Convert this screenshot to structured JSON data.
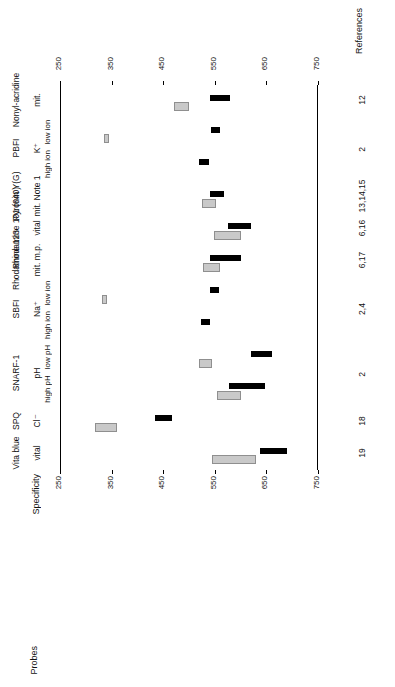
{
  "headers": {
    "probes": "Probes",
    "specificity": "Specificity",
    "references": "References"
  },
  "axis": {
    "ticks": [
      250,
      350,
      450,
      550,
      650,
      750
    ],
    "min": 250,
    "max": 750,
    "label": ""
  },
  "chart_data": {
    "type": "bar",
    "title": "",
    "xlabel": "Probes",
    "ylabel": "Wavelength (nm)",
    "ylim": [
      250,
      750
    ],
    "grid": false,
    "legend": [
      "excitation (black)",
      "emission (gray)"
    ],
    "categories": [
      "Nonyl-acridine",
      "PBFI",
      "Pyronin Y(G)",
      "Rhodamine 101 (640)",
      "Rhodamine 123",
      "SBFI",
      "SNARF-1",
      "SPQ",
      "Vita blue"
    ],
    "rows": [
      {
        "probe": "Nonyl-acridine",
        "sub": "",
        "specificity": "mit.",
        "references": "12",
        "bars": [
          {
            "series": "black",
            "start": 540,
            "end": 580,
            "lane": 0
          },
          {
            "series": "gray",
            "start": 470,
            "end": 500,
            "lane": 1
          }
        ]
      },
      {
        "probe": "PBFI",
        "sub": "low ion",
        "specificity": "K⁺",
        "references": "2",
        "bars": [
          {
            "series": "black",
            "start": 543,
            "end": 560,
            "lane": 0
          },
          {
            "series": "gray",
            "start": 335,
            "end": 345,
            "lane": 1
          }
        ]
      },
      {
        "probe": "PBFI",
        "sub": "high ion",
        "specificity": "",
        "references": "",
        "bars": [
          {
            "series": "black",
            "start": 520,
            "end": 538,
            "lane": 0
          }
        ]
      },
      {
        "probe": "Pyronin Y(G)",
        "sub": "",
        "specificity": "mit. Note 1",
        "references": "13,14,15",
        "bars": [
          {
            "series": "black",
            "start": 540,
            "end": 568,
            "lane": 0
          },
          {
            "series": "gray",
            "start": 525,
            "end": 552,
            "lane": 1
          }
        ]
      },
      {
        "probe": "Rhodamine 101 (640)",
        "sub": "",
        "specificity": "vital",
        "references": "6,16",
        "bars": [
          {
            "series": "black",
            "start": 575,
            "end": 620,
            "lane": 0
          },
          {
            "series": "gray",
            "start": 548,
            "end": 600,
            "lane": 1
          }
        ]
      },
      {
        "probe": "Rhodamine 123",
        "sub": "",
        "specificity": "mit. m.p.",
        "references": "6,17",
        "bars": [
          {
            "series": "black",
            "start": 540,
            "end": 600,
            "lane": 0
          },
          {
            "series": "gray",
            "start": 528,
            "end": 560,
            "lane": 1
          }
        ]
      },
      {
        "probe": "SBFI",
        "sub": "low ion",
        "specificity": "Na⁺",
        "references": "2,4",
        "bars": [
          {
            "series": "black",
            "start": 540,
            "end": 558,
            "lane": 0
          },
          {
            "series": "gray",
            "start": 332,
            "end": 342,
            "lane": 1
          }
        ]
      },
      {
        "probe": "SBFI",
        "sub": "high ion",
        "specificity": "",
        "references": "",
        "bars": [
          {
            "series": "black",
            "start": 523,
            "end": 540,
            "lane": 0
          }
        ]
      },
      {
        "probe": "SNARF-1",
        "sub": "low pH",
        "specificity": "pH",
        "references": "2",
        "bars": [
          {
            "series": "black",
            "start": 620,
            "end": 660,
            "lane": 0
          },
          {
            "series": "gray",
            "start": 520,
            "end": 545,
            "lane": 1
          }
        ]
      },
      {
        "probe": "SNARF-1",
        "sub": "high pH",
        "specificity": "",
        "references": "",
        "bars": [
          {
            "series": "black",
            "start": 578,
            "end": 648,
            "lane": 0
          },
          {
            "series": "gray",
            "start": 555,
            "end": 600,
            "lane": 1
          }
        ]
      },
      {
        "probe": "SPQ",
        "sub": "",
        "specificity": "Cl⁻",
        "references": "18",
        "bars": [
          {
            "series": "black",
            "start": 435,
            "end": 468,
            "lane": 0
          },
          {
            "series": "gray",
            "start": 318,
            "end": 360,
            "lane": 1
          }
        ]
      },
      {
        "probe": "Vita blue",
        "sub": "",
        "specificity": "vital",
        "references": "19",
        "bars": [
          {
            "series": "black",
            "start": 638,
            "end": 690,
            "lane": 0
          },
          {
            "series": "gray",
            "start": 545,
            "end": 630,
            "lane": 1
          }
        ]
      }
    ]
  }
}
